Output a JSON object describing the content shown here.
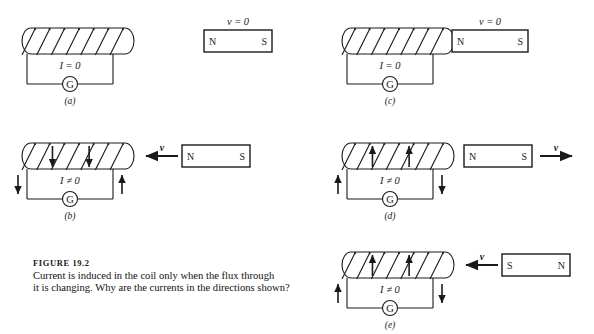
{
  "figure": {
    "caption_label": "FIGURE  19.2",
    "caption_line1": "Current is induced in the coil only when the flux through",
    "caption_line2": "it is changing. Why are the currents in the directions shown?",
    "stroke_color": "#1a1a1a",
    "background_color": "#ffffff"
  },
  "symbols": {
    "galvanometer": "G",
    "current_zero": "I = 0",
    "current_nonzero": "I ≠ 0",
    "velocity_zero": "v = 0",
    "velocity": "v",
    "pole_north": "N",
    "pole_south": "S"
  },
  "panels": [
    {
      "id": "a",
      "label": "(a)",
      "coil": {
        "x": 22,
        "y": 28,
        "width": 112,
        "height": 26,
        "turns": 6,
        "turn_arrows": "none",
        "lead_left_arrow": "none",
        "lead_right_arrow": "none",
        "current_label": "I = 0"
      },
      "magnet": {
        "x": 204,
        "y": 30,
        "width": 68,
        "height": 22,
        "left_pole": "N",
        "right_pole": "S",
        "velocity_label": "v = 0",
        "velocity_position": "above",
        "motion": "none"
      }
    },
    {
      "id": "c",
      "label": "(c)",
      "coil": {
        "x": 342,
        "y": 28,
        "width": 112,
        "height": 26,
        "turns": 6,
        "turn_arrows": "none",
        "lead_left_arrow": "none",
        "lead_right_arrow": "none",
        "current_label": "I = 0"
      },
      "magnet": {
        "x": 452,
        "y": 30,
        "width": 76,
        "height": 22,
        "left_pole": "N",
        "right_pole": "S",
        "velocity_label": "v = 0",
        "velocity_position": "above",
        "motion": "none"
      }
    },
    {
      "id": "b",
      "label": "(b)",
      "coil": {
        "x": 22,
        "y": 143,
        "width": 112,
        "height": 26,
        "turns": 6,
        "turn_arrows": "down",
        "lead_left_arrow": "down",
        "lead_right_arrow": "up",
        "current_label": "I ≠ 0"
      },
      "magnet": {
        "x": 182,
        "y": 145,
        "width": 68,
        "height": 22,
        "left_pole": "N",
        "right_pole": "S",
        "velocity_label": "v",
        "velocity_position": "arrow-left",
        "motion": "left",
        "arrow_x": 146,
        "arrow_y": 156,
        "arrow_length": 32
      }
    },
    {
      "id": "d",
      "label": "(d)",
      "coil": {
        "x": 342,
        "y": 143,
        "width": 112,
        "height": 26,
        "turns": 6,
        "turn_arrows": "up",
        "lead_left_arrow": "up",
        "lead_right_arrow": "down",
        "current_label": "I ≠ 0"
      },
      "magnet": {
        "x": 464,
        "y": 145,
        "width": 68,
        "height": 22,
        "left_pole": "N",
        "right_pole": "S",
        "velocity_label": "v",
        "velocity_position": "arrow-right",
        "motion": "right",
        "arrow_x": 540,
        "arrow_y": 156,
        "arrow_length": 32
      }
    },
    {
      "id": "e",
      "label": "(e)",
      "coil": {
        "x": 342,
        "y": 252,
        "width": 112,
        "height": 26,
        "turns": 6,
        "turn_arrows": "up",
        "lead_left_arrow": "up",
        "lead_right_arrow": "down",
        "current_label": "I ≠ 0"
      },
      "magnet": {
        "x": 502,
        "y": 254,
        "width": 68,
        "height": 22,
        "left_pole": "S",
        "right_pole": "N",
        "velocity_label": "v",
        "velocity_position": "arrow-left",
        "motion": "left",
        "arrow_x": 466,
        "arrow_y": 265,
        "arrow_length": 32
      }
    }
  ]
}
